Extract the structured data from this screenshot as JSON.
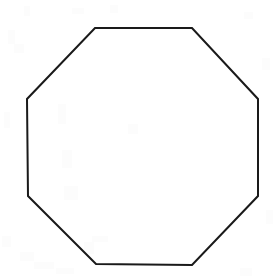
{
  "image": {
    "title": "Octagon line drawing",
    "width": 277,
    "height": 280,
    "background_color": "#ffffff",
    "description": "A single unfilled regular octagon outline drawn in black on a white scanned page background"
  },
  "shape": {
    "name": "octagon",
    "type": "polygon",
    "sides": 8,
    "filled": false,
    "fill_color": "none",
    "stroke_color": "#1a1a1a",
    "stroke_width": 2,
    "stroke_style": "solid",
    "vertices": [
      {
        "label": "top-left",
        "x": 95,
        "y": 28
      },
      {
        "label": "top-right",
        "x": 192,
        "y": 28
      },
      {
        "label": "right-top",
        "x": 258,
        "y": 99
      },
      {
        "label": "right-bottom",
        "x": 258,
        "y": 196
      },
      {
        "label": "bottom-right",
        "x": 192,
        "y": 265
      },
      {
        "label": "bottom-left",
        "x": 96,
        "y": 264
      },
      {
        "label": "left-bottom",
        "x": 28,
        "y": 196
      },
      {
        "label": "left-top",
        "x": 27,
        "y": 99
      }
    ],
    "points_attr": "95,28 192,28 258,99 258,196 192,265 96,264 28,196 27,99",
    "bounding_box": {
      "x": 27,
      "y": 28,
      "width": 231,
      "height": 237
    }
  },
  "scan_texture": {
    "color": "#fcfcfc",
    "specks": [
      {
        "x": 8,
        "y": 30,
        "w": 7,
        "h": 14
      },
      {
        "x": 14,
        "y": 44,
        "w": 10,
        "h": 9
      },
      {
        "x": 24,
        "y": 6,
        "w": 6,
        "h": 10
      },
      {
        "x": 72,
        "y": 8,
        "w": 12,
        "h": 6
      },
      {
        "x": 110,
        "y": 5,
        "w": 8,
        "h": 8
      },
      {
        "x": 244,
        "y": 12,
        "w": 9,
        "h": 7
      },
      {
        "x": 262,
        "y": 58,
        "w": 8,
        "h": 12
      },
      {
        "x": 4,
        "y": 112,
        "w": 6,
        "h": 16
      },
      {
        "x": 2,
        "y": 236,
        "w": 9,
        "h": 11
      },
      {
        "x": 20,
        "y": 252,
        "w": 14,
        "h": 9
      },
      {
        "x": 34,
        "y": 262,
        "w": 20,
        "h": 7
      },
      {
        "x": 56,
        "y": 268,
        "w": 18,
        "h": 6
      },
      {
        "x": 84,
        "y": 242,
        "w": 10,
        "h": 12
      },
      {
        "x": 92,
        "y": 236,
        "w": 16,
        "h": 6
      },
      {
        "x": 128,
        "y": 124,
        "w": 10,
        "h": 10
      },
      {
        "x": 58,
        "y": 104,
        "w": 8,
        "h": 20
      },
      {
        "x": 62,
        "y": 150,
        "w": 10,
        "h": 18
      },
      {
        "x": 64,
        "y": 186,
        "w": 14,
        "h": 14
      },
      {
        "x": 240,
        "y": 268,
        "w": 12,
        "h": 8
      },
      {
        "x": 266,
        "y": 210,
        "w": 7,
        "h": 14
      }
    ]
  }
}
